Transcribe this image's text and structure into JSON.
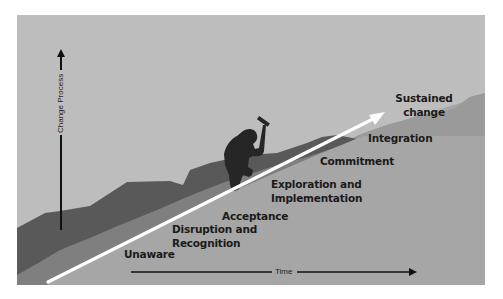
{
  "figure": {
    "y_axis": {
      "label": "Change Process",
      "direction": "up"
    },
    "x_axis": {
      "label": "Time",
      "direction": "right"
    },
    "arrow": {
      "color": "#ffffff",
      "meaning": "progress-through-stages"
    },
    "figure_icon": "mountain-climber-icon",
    "stages": [
      {
        "label": "Unaware"
      },
      {
        "label": "Disruption and\nRecognition",
        "line1": "Disruption and",
        "line2": "Recognition"
      },
      {
        "label": "Acceptance"
      },
      {
        "label": "Exploration and\nImplementation",
        "line1": "Exploration and",
        "line2": "Implementation"
      },
      {
        "label": "Commitment"
      },
      {
        "label": "Integration"
      },
      {
        "label": "Sustained\nchange",
        "line1": "Sustained",
        "line2": "change"
      }
    ],
    "colors": {
      "sky": "#bdbdbd",
      "dark_ridge": "#595959",
      "mid_band": "#7f7f7f",
      "slope": "#a6a6a6",
      "right_hill": "#9a9a9a",
      "climber": "#262626",
      "text": "#1a1a1a"
    }
  }
}
